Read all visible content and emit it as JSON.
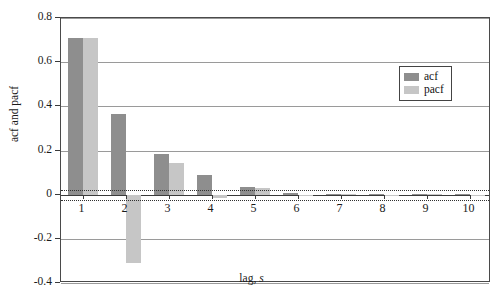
{
  "chart_data": {
    "type": "bar",
    "title": "",
    "xlabel": "lag, s",
    "ylabel": "acf and pacf",
    "categories": [
      "1",
      "2",
      "3",
      "4",
      "5",
      "6",
      "7",
      "8",
      "9",
      "10"
    ],
    "series": [
      {
        "name": "acf",
        "color": "#8e8e8e",
        "values": [
          0.71,
          0.365,
          0.185,
          0.09,
          0.035,
          0.008,
          0.005,
          0.004,
          0.003,
          0.002
        ]
      },
      {
        "name": "pacf",
        "color": "#c6c6c6",
        "values": [
          0.71,
          -0.31,
          0.145,
          -0.015,
          0.03,
          -0.006,
          0.004,
          -0.003,
          0.002,
          -0.002
        ]
      }
    ],
    "ylim": [
      -0.4,
      0.8
    ],
    "yticks": [
      "0.8",
      "0.6",
      "0.4",
      "0.2",
      "0",
      "-0.2",
      "-0.4"
    ],
    "ytick_values": [
      0.8,
      0.6,
      0.4,
      0.2,
      0,
      -0.2,
      -0.4
    ],
    "xticks": [
      "1",
      "2",
      "3",
      "4",
      "5",
      "6",
      "7",
      "8",
      "9",
      "10"
    ],
    "grid": true,
    "legend_position": "upper right",
    "confidence_bounds": [
      0.02,
      -0.025
    ],
    "zero_line": 0
  },
  "legend": {
    "entries": [
      {
        "label": "acf"
      },
      {
        "label": "pacf"
      }
    ]
  },
  "axes": {
    "y_title": "acf and pacf",
    "x_title_main": "lag,",
    "x_title_italic": "s"
  }
}
